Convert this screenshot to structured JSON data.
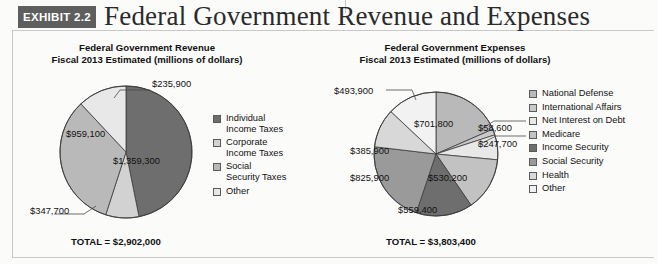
{
  "header": {
    "badge": "EXHIBIT 2.2",
    "title": "Federal Government Revenue and Expenses"
  },
  "colors": {
    "dark": "#6e6e6e",
    "mid": "#9a9a9a",
    "light": "#b9b9b9",
    "lighter": "#d2d2d2",
    "lightest": "#e8e8e8",
    "pale": "#f2f2f2",
    "white": "#ffffff",
    "swatch_border": "#5a5a5a",
    "badge_bg": "#5e5e5e",
    "frame": "#c8c8c8"
  },
  "revenue": {
    "title_line1": "Federal Government Revenue",
    "title_line2": "Fiscal 2013 Estimated (millions of dollars)",
    "total_label": "TOTAL = $2,902,000",
    "legend": [
      {
        "label": "Individual Income Taxes",
        "line1": "Individual",
        "line2": "Income Taxes",
        "color": "#6e6e6e"
      },
      {
        "label": "Corporate Income Taxes",
        "line1": "Corporate",
        "line2": "Income Taxes",
        "color": "#d2d2d2"
      },
      {
        "label": "Social Security Taxes",
        "line1": "Social",
        "line2": "Security Taxes",
        "color": "#b9b9b9"
      },
      {
        "label": "Other",
        "line1": "Other",
        "line2": "",
        "color": "#e8e8e8"
      }
    ]
  },
  "expenses": {
    "title_line1": "Federal Government Expenses",
    "title_line2": "Fiscal 2013 Estimated (millions of dollars)",
    "total_label": "TOTAL = $3,803,400",
    "legend": [
      {
        "label": "National Defense",
        "color": "#b9b9b9"
      },
      {
        "label": "International Affairs",
        "color": "#c9c9c9"
      },
      {
        "label": "Net Interest on Debt",
        "color": "#e8e8e8"
      },
      {
        "label": "Medicare",
        "color": "#c2c2c2"
      },
      {
        "label": "Income Security",
        "color": "#6e6e6e"
      },
      {
        "label": "Social Security",
        "color": "#9a9a9a"
      },
      {
        "label": "Health",
        "color": "#d8d8d8"
      },
      {
        "label": "Other",
        "color": "#f2f2f2"
      }
    ]
  },
  "labels": {
    "rev_235900": "$235,900",
    "rev_959100": "$959,100",
    "rev_1359300": "$1,359,300",
    "rev_347700": "$347,700",
    "exp_493900": "$493,900",
    "exp_701800": "$701,800",
    "exp_58600": "$58,600",
    "exp_247700": "$247,700",
    "exp_385900": "$385,900",
    "exp_530200": "$530,200",
    "exp_825900": "$825,900",
    "exp_559400": "$559,400"
  },
  "chart_data": [
    {
      "type": "pie",
      "title": "Federal Government Revenue",
      "subtitle": "Fiscal 2013 Estimated (millions of dollars)",
      "unit": "millions of dollars",
      "total": 2902000,
      "total_label": "TOTAL = $2,902,000",
      "legend_position": "right",
      "labels": [
        "Individual Income Taxes",
        "Corporate Income Taxes",
        "Social Security Taxes",
        "Other"
      ],
      "values": [
        1359300,
        235900,
        959100,
        347700
      ],
      "value_labels": [
        "$1,359,300",
        "$235,900",
        "$959,100",
        "$347,700"
      ],
      "percentages": [
        46.8,
        8.1,
        33.0,
        12.0
      ],
      "colors": [
        "#6e6e6e",
        "#d2d2d2",
        "#b9b9b9",
        "#e8e8e8"
      ]
    },
    {
      "type": "pie",
      "title": "Federal Government Expenses",
      "subtitle": "Fiscal 2013 Estimated (millions of dollars)",
      "unit": "millions of dollars",
      "total": 3803400,
      "total_label": "TOTAL = $3,803,400",
      "legend_position": "right",
      "labels": [
        "National Defense",
        "International Affairs",
        "Net Interest on Debt",
        "Medicare",
        "Income Security",
        "Social Security",
        "Health",
        "Other"
      ],
      "values": [
        701800,
        58600,
        247700,
        530200,
        559400,
        825900,
        385900,
        493900
      ],
      "value_labels": [
        "$701,800",
        "$58,600",
        "$247,700",
        "$530,200",
        "$559,400",
        "$825,900",
        "$385,900",
        "$493,900"
      ],
      "percentages": [
        18.5,
        1.5,
        6.5,
        13.9,
        14.7,
        21.7,
        10.1,
        13.0
      ],
      "colors": [
        "#b9b9b9",
        "#c9c9c9",
        "#e8e8e8",
        "#c2c2c2",
        "#6e6e6e",
        "#9a9a9a",
        "#d8d8d8",
        "#f2f2f2"
      ]
    }
  ]
}
